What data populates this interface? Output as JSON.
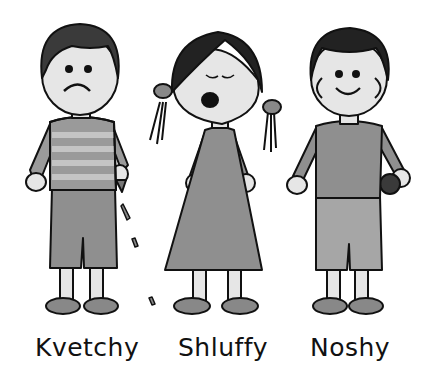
{
  "illustration": {
    "style": "grayscale cartoon",
    "characters": [
      {
        "name": "Kvetchy",
        "expression": "frown",
        "outfit": "striped shirt, shorts",
        "holding": "crumbling cookie"
      },
      {
        "name": "Shluffy",
        "expression": "sleepy yawn",
        "outfit": "dress, pigtails"
      },
      {
        "name": "Noshy",
        "expression": "smile",
        "outfit": "shirt, shorts",
        "holding": "cookie"
      }
    ]
  },
  "colors": {
    "outline": "#111111",
    "hair": "#2a2a2a",
    "skin": "#e6e6e6",
    "cloth": "#8f8f8f",
    "stripe_light": "#b5b5b5",
    "shoe": "#888888"
  }
}
